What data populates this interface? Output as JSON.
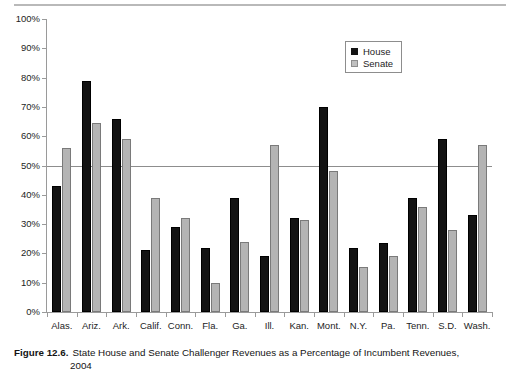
{
  "figure": {
    "caption_label": "Figure 12.6.",
    "caption_text": "State House and Senate Challenger Revenues as a Percentage of Incumbent Revenues,",
    "caption_line2": "2004"
  },
  "legend": {
    "position": "inside-top-right",
    "entries": [
      {
        "label": "House",
        "color": "#131313"
      },
      {
        "label": "Senate",
        "color": "#c0c0c0"
      }
    ]
  },
  "axis": {
    "y_ticks": [
      "100%",
      "90%",
      "80%",
      "70%",
      "60%",
      "50%",
      "40%",
      "30%",
      "20%",
      "10%",
      "0%"
    ]
  },
  "chart_data": {
    "type": "bar",
    "title": "State House and Senate Challenger Revenues as a Percentage of Incumbent Revenues, 2004",
    "xlabel": "",
    "ylabel": "",
    "ylim": [
      0,
      100
    ],
    "ytick_step": 10,
    "ytick_format": "percent",
    "grid": false,
    "reference_lines": [
      {
        "value": 50,
        "color": "#8d8d8d"
      }
    ],
    "legend_position": "inside-top-right",
    "categories": [
      "Alas.",
      "Ariz.",
      "Ark.",
      "Calif.",
      "Conn.",
      "Fla.",
      "Ga.",
      "Ill.",
      "Kan.",
      "Mont.",
      "N.Y.",
      "Pa.",
      "Tenn.",
      "S.D.",
      "Wash."
    ],
    "series": [
      {
        "name": "House",
        "color": "#131313",
        "values": [
          43,
          79,
          66,
          21,
          29,
          22,
          39,
          19,
          32,
          70,
          22,
          23.5,
          39,
          59,
          33
        ]
      },
      {
        "name": "Senate",
        "color": "#c0c0c0",
        "values": [
          56,
          64.5,
          59,
          39,
          32,
          10,
          24,
          57,
          31.5,
          48,
          15.5,
          19,
          36,
          28,
          57
        ]
      }
    ]
  }
}
